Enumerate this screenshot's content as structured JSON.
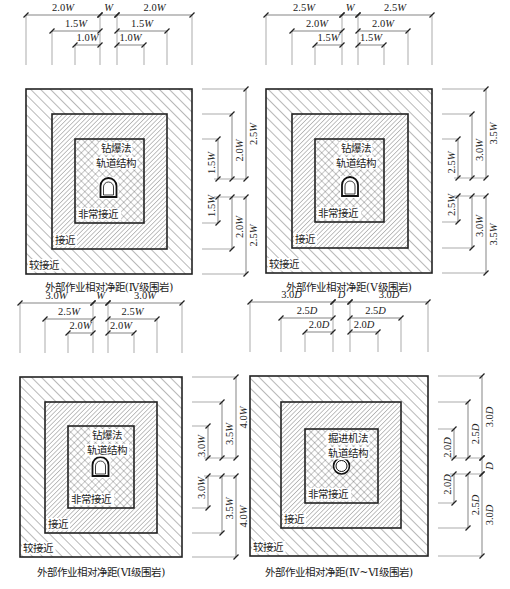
{
  "figure": {
    "panels": [
      {
        "id": "iv",
        "caption": "外部作业相对净距(Ⅳ级围岩)",
        "method": "钻爆法",
        "structure": "轨道结构",
        "tunnel_shape": "horseshoe",
        "zones": {
          "very_close": "非常接近",
          "close": "接近",
          "fairly_close": "较接近"
        },
        "unit": "W",
        "top_dims": {
          "outer": "2.0W",
          "middle": "1.5W",
          "inner": "1.0W",
          "center": "W"
        },
        "side_dims": {
          "outer": "2.5W",
          "middle": "2.0W",
          "inner": "1.5W",
          "center": ""
        }
      },
      {
        "id": "v",
        "caption": "外部作业相对净距(Ⅴ级围岩)",
        "method": "钻爆法",
        "structure": "轨道结构",
        "tunnel_shape": "horseshoe",
        "zones": {
          "very_close": "非常接近",
          "close": "接近",
          "fairly_close": "较接近"
        },
        "unit": "W",
        "top_dims": {
          "outer": "2.5W",
          "middle": "2.0W",
          "inner": "1.5W",
          "center": "W"
        },
        "side_dims": {
          "outer": "3.5W",
          "middle": "3.0W",
          "inner": "2.5W",
          "center": ""
        }
      },
      {
        "id": "vi",
        "caption": "外部作业相对净距(Ⅵ级围岩)",
        "method": "钻爆法",
        "structure": "轨道结构",
        "tunnel_shape": "horseshoe",
        "zones": {
          "very_close": "非常接近",
          "close": "接近",
          "fairly_close": "较接近"
        },
        "unit": "W",
        "top_dims": {
          "outer": "3.0W",
          "middle": "2.5W",
          "inner": "2.0W",
          "center": "W"
        },
        "side_dims": {
          "outer": "4.0W",
          "middle": "3.5W",
          "inner": "3.0W",
          "center": ""
        }
      },
      {
        "id": "iv-vi",
        "caption": "外部作业相对净距(Ⅳ~Ⅵ级围岩)",
        "method": "掘进机法",
        "structure": "轨道结构",
        "tunnel_shape": "circle",
        "zones": {
          "very_close": "非常接近",
          "close": "接近",
          "fairly_close": "较接近"
        },
        "unit": "D",
        "top_dims": {
          "outer": "3.0D",
          "middle": "2.5D",
          "inner": "2.0D",
          "center": "D"
        },
        "side_dims": {
          "outer": "3.0D",
          "middle": "2.5D",
          "inner": "2.0D",
          "center": "D"
        }
      }
    ]
  }
}
